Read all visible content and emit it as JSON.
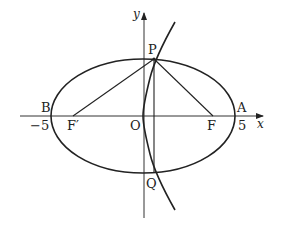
{
  "figure": {
    "type": "conic-diagram",
    "axes": {
      "x_label": "x",
      "y_label": "y",
      "origin_label": "O"
    },
    "ticks": {
      "left": "−5",
      "right": "5"
    },
    "points": {
      "A": "A",
      "B": "B",
      "F": "F",
      "F_prime": "F′",
      "P": "P",
      "Q": "Q"
    },
    "segments": [
      "PF'",
      "PF",
      "PQ"
    ],
    "curves": [
      "ellipse",
      "hyperbola-branch"
    ],
    "colors": {
      "stroke": "#222222",
      "background": "#ffffff"
    }
  }
}
